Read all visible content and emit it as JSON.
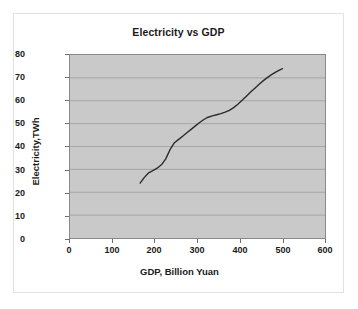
{
  "chart_data": {
    "type": "line",
    "title": "Electricity vs GDP",
    "xlabel": "GDP, Billion Yuan",
    "ylabel": "Electricity,TWh",
    "xlim": [
      0,
      600
    ],
    "ylim": [
      0,
      80
    ],
    "xticks": [
      0,
      100,
      200,
      300,
      400,
      500,
      600
    ],
    "yticks": [
      0,
      10,
      20,
      30,
      40,
      50,
      60,
      70,
      80
    ],
    "grid": "horizontal",
    "legend": "none",
    "plot_background": "#c9c9c9",
    "line_color": "#2b2b2b",
    "series": [
      {
        "name": "Electricity vs GDP",
        "x": [
          165,
          175,
          185,
          195,
          205,
          215,
          225,
          235,
          245,
          255,
          265,
          275,
          285,
          295,
          305,
          315,
          325,
          335,
          345,
          355,
          365,
          375,
          385,
          395,
          405,
          415,
          425,
          435,
          445,
          455,
          465,
          475,
          485,
          495,
          500
        ],
        "y": [
          24.0,
          26.5,
          28.5,
          29.5,
          30.5,
          32.0,
          34.5,
          38.5,
          41.5,
          43.0,
          44.5,
          46.0,
          47.5,
          49.0,
          50.5,
          51.8,
          52.8,
          53.4,
          53.9,
          54.4,
          55.0,
          55.8,
          57.0,
          58.5,
          60.2,
          62.0,
          63.8,
          65.5,
          67.2,
          68.8,
          70.2,
          71.5,
          72.6,
          73.6,
          74.0
        ]
      }
    ]
  },
  "axis": {
    "y_tick_labels": [
      "80",
      "70",
      "60",
      "50",
      "40",
      "30",
      "20",
      "10",
      "0"
    ],
    "x_tick_labels": [
      "0",
      "100",
      "200",
      "300",
      "400",
      "500",
      "600"
    ]
  }
}
